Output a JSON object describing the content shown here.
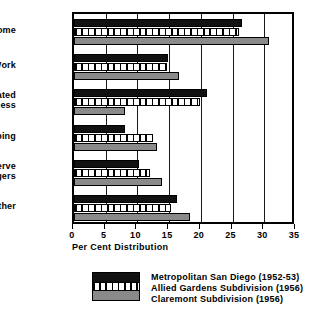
{
  "chart_data": {
    "type": "bar",
    "orientation": "horizontal",
    "title": "",
    "xlabel": "Per Cent Distribution",
    "ylabel": "",
    "xlim": [
      0,
      35
    ],
    "xticks": [
      0,
      5,
      10,
      15,
      20,
      25,
      30,
      35
    ],
    "xtick_labels": [
      "0",
      "5",
      "10",
      "15",
      "20",
      "25",
      "30",
      "35"
    ],
    "grid": "vertical",
    "legend_position": "bottom-center",
    "categories": [
      "Home",
      "Work",
      "Related Business",
      "Shopping",
      "Serve Passengers",
      "Other"
    ],
    "category_label_lines": [
      [
        "Home"
      ],
      [
        "Work"
      ],
      [
        "Related",
        "Business"
      ],
      [
        "Shopping"
      ],
      [
        "Serve",
        "Passengers"
      ],
      [
        "Other"
      ]
    ],
    "series": [
      {
        "name": "Metropolitan San Diego (1952-53)",
        "style": "black",
        "color": "#111111",
        "values": [
          26.5,
          14.8,
          21.0,
          8.0,
          10.2,
          16.2
        ]
      },
      {
        "name": "Allied Gardens Subdivision (1956)",
        "style": "hatched",
        "color": "#ffffff",
        "values": [
          26.0,
          14.7,
          19.8,
          12.5,
          12.0,
          15.3
        ]
      },
      {
        "name": "Claremont Subdivision (1956)",
        "style": "gray",
        "color": "#8a8a8a",
        "values": [
          30.8,
          16.6,
          8.1,
          13.1,
          13.9,
          18.3
        ]
      }
    ]
  },
  "legend": {
    "entries": [
      "Metropolitan San Diego (1952-53)",
      "Allied Gardens Subdivision (1956)",
      "Claremont Subdivision (1956)"
    ]
  }
}
